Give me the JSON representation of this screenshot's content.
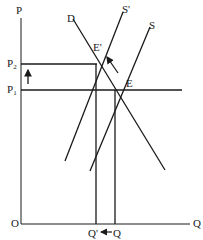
{
  "diagram": {
    "type": "supply-demand shift",
    "axes": {
      "y_label": "P",
      "x_label": "Q",
      "origin_label": "O"
    },
    "curves": [
      {
        "name": "D",
        "label": "D"
      },
      {
        "name": "S'",
        "label": "S'"
      },
      {
        "name": "S",
        "label": "S"
      }
    ],
    "equilibria": [
      {
        "name": "E'",
        "label": "E'"
      },
      {
        "name": "E",
        "label": "E"
      }
    ],
    "price_levels": [
      {
        "name": "P2",
        "base": "P",
        "sub": "2"
      },
      {
        "name": "P1",
        "base": "P",
        "sub": "1"
      }
    ],
    "quantity_levels": [
      {
        "name": "Q'",
        "label": "Q'"
      },
      {
        "name": "Q",
        "label": "Q"
      }
    ],
    "annotations": {
      "price_arrow": "up",
      "quantity_arrow": "left",
      "shift_arrow": "up-left"
    },
    "colors": {
      "line": "#1a1a1a",
      "background": "#ffffff"
    }
  }
}
